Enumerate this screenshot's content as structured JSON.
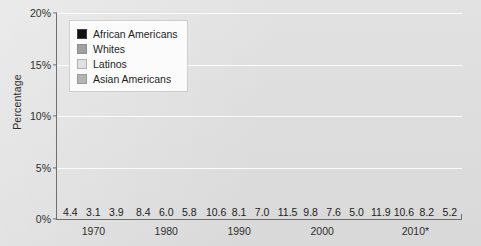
{
  "chart_data": {
    "type": "bar",
    "title": "",
    "xlabel": "",
    "ylabel": "Percentage",
    "ylim": [
      0,
      20
    ],
    "yticks": [
      "0%",
      "5%",
      "10%",
      "15%",
      "20%"
    ],
    "ytick_values": [
      0,
      5,
      10,
      15,
      20
    ],
    "grid": true,
    "legend_position": "top-left",
    "categories": [
      "1970",
      "1980",
      "1990",
      "2000",
      "2010*"
    ],
    "series": [
      {
        "name": "African Americans",
        "color": "#111111",
        "values": [
          4.4,
          8.4,
          10.6,
          11.5,
          11.9
        ]
      },
      {
        "name": "Whites",
        "color": "#a0a0a0",
        "values": [
          3.1,
          6.0,
          8.1,
          9.8,
          10.6
        ]
      },
      {
        "name": "Latinos",
        "color": "#e0e0e0",
        "values": [
          3.9,
          5.8,
          7.0,
          7.6,
          8.2
        ]
      },
      {
        "name": "Asian Americans",
        "color": "#b4b4b4",
        "values": [
          null,
          null,
          null,
          5.0,
          5.2
        ]
      }
    ],
    "data_labels": [
      [
        "4.4",
        "3.1",
        "3.9"
      ],
      [
        "8.4",
        "6.0",
        "5.8"
      ],
      [
        "10.6",
        "8.1",
        "7.0"
      ],
      [
        "11.5",
        "9.8",
        "7.6",
        "5.0"
      ],
      [
        "11.9",
        "10.6",
        "8.2",
        "5.2"
      ]
    ]
  },
  "legend": {
    "items": [
      {
        "label": "African Americans"
      },
      {
        "label": "Whites"
      },
      {
        "label": "Latinos"
      },
      {
        "label": "Asian Americans"
      }
    ]
  }
}
